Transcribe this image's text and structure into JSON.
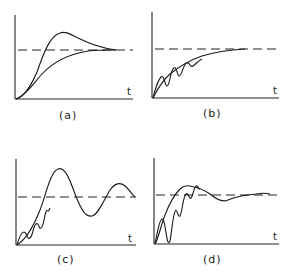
{
  "figure": {
    "panels": [
      {
        "id": "a",
        "label": "(a)",
        "axis_label": "t",
        "description": "Step response: overshoot curve and monotonic curve converging to dashed setpoint"
      },
      {
        "id": "b",
        "label": "(b)",
        "axis_label": "t",
        "description": "Step response with small oscillations during rise, converging smoothly to setpoint"
      },
      {
        "id": "c",
        "label": "(c)",
        "axis_label": "t",
        "description": "Step response with initial ripples then large sustained oscillation around setpoint"
      },
      {
        "id": "d",
        "label": "(d)",
        "axis_label": "t",
        "description": "Step response with large initial oscillations, small overshoot, settling near setpoint"
      }
    ],
    "colors": {
      "line": "#1a1a1a",
      "background": "#ffffff"
    }
  }
}
